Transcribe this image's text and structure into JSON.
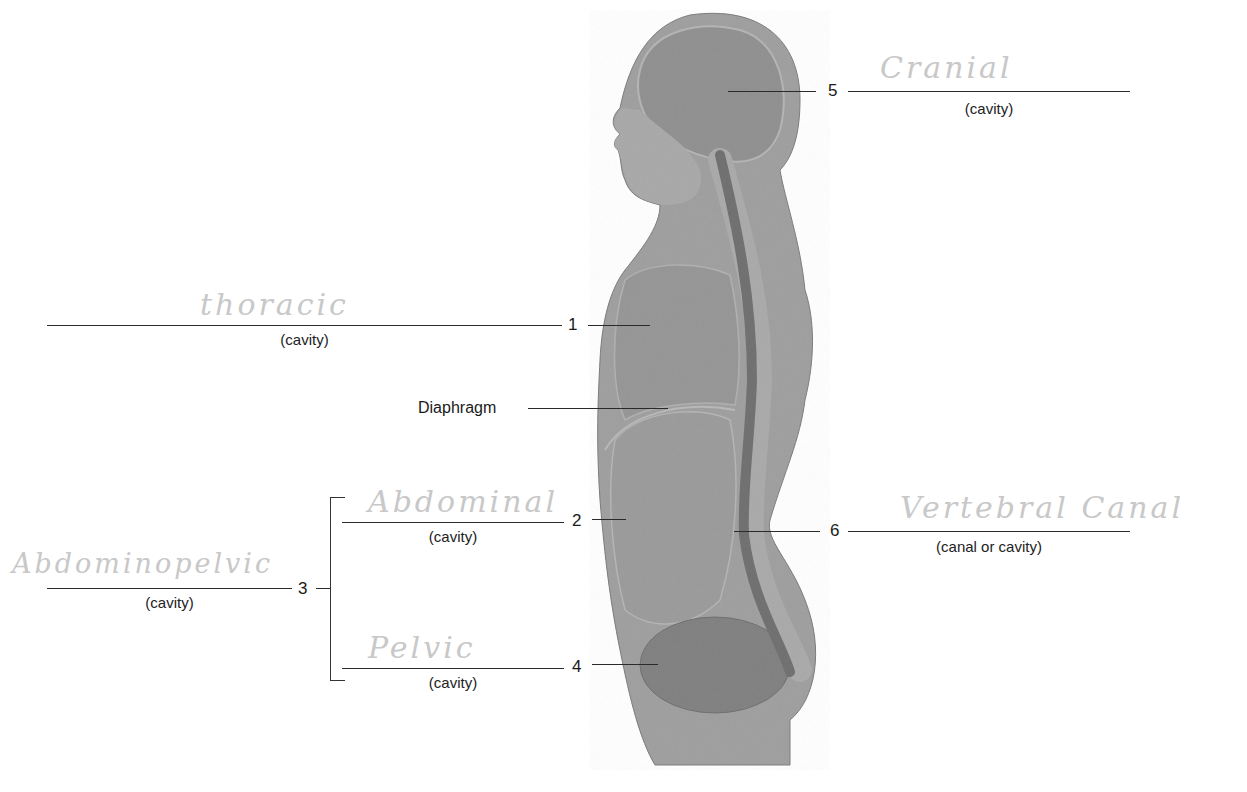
{
  "diagram": {
    "figure": "human-torso-sagittal-section",
    "colors": {
      "body": "#9a9a9a",
      "body_dark": "#7c7c7c",
      "cavity": "#888888",
      "spine": "#6e6e6e",
      "line": "#2a2a2a",
      "handwriting": "#c8c8c8"
    },
    "labels": {
      "diaphragm": "Diaphragm"
    },
    "blanks": [
      {
        "number": "1",
        "sub": "(cavity)",
        "answer": "thoracic"
      },
      {
        "number": "2",
        "sub": "(cavity)",
        "answer": "Abdominal"
      },
      {
        "number": "3",
        "sub": "(cavity)",
        "answer": "Abdominopelvic"
      },
      {
        "number": "4",
        "sub": "(cavity)",
        "answer": "Pelvic"
      },
      {
        "number": "5",
        "sub": "(cavity)",
        "answer": "Cranial"
      },
      {
        "number": "6",
        "sub": "(canal or cavity)",
        "answer": "Vertebral Canal"
      }
    ]
  }
}
